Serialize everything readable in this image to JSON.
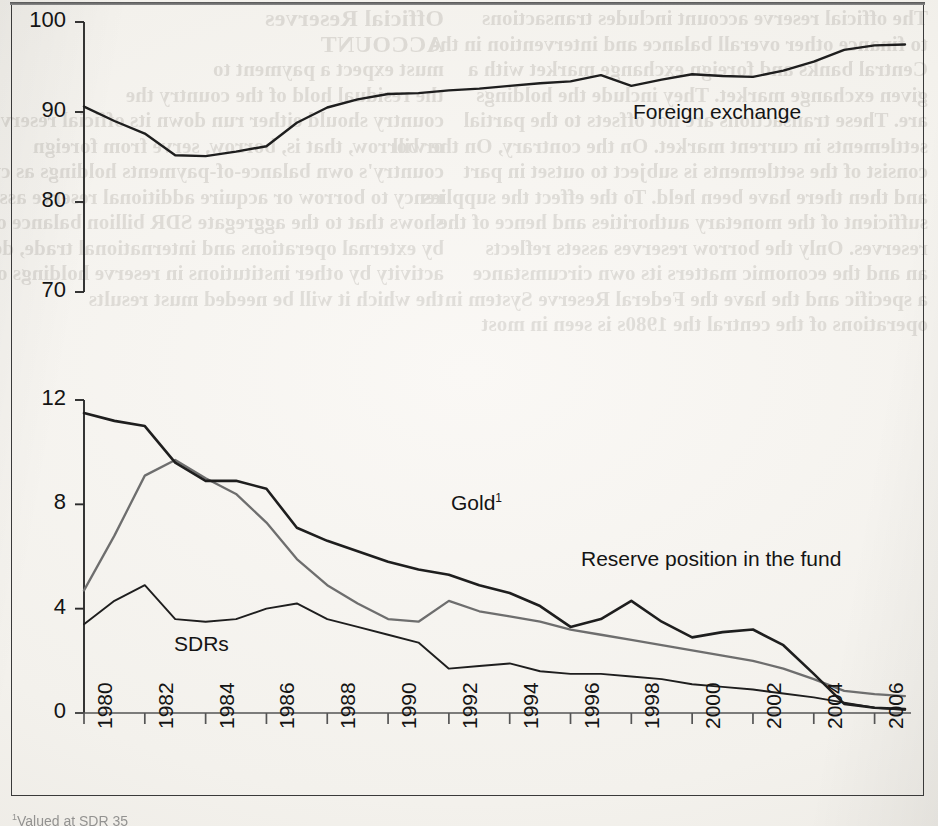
{
  "page": {
    "background_color": "#f4f2ee",
    "frame_color": "#3a3a3a"
  },
  "footnote": {
    "marker": "1",
    "text": "Valued at SDR 35"
  },
  "bleed_through": {
    "note": "faint mirrored text showing through from the reverse side of the scanned page",
    "left_column": [
      "Official Reserves",
      "ACCOUNT",
      "must expect a payment to",
      "the residual hold of the country the",
      "country should either run down its official reserves",
      "or borrow, that is, borrow, serve from foreign",
      "country's own balance-of-payments holdings as cur-",
      "rency to borrow or acquire additional reserve assets",
      "shows that to the aggregate SDR billion balance of pay-",
      "by external operations and international trade, deb-",
      "activity by other institutions in reserve holdings of",
      "the which it will be needed must results"
    ],
    "right_column": [
      "The official reserve account includes transactions",
      "to finance other overall balance and intervention in the",
      "Central banks and foreign exchange market with a",
      "given exchange market. They include the holdings",
      "are. These transactions are not offsets to the partial",
      "settlements in current market. On the contrary, On the will",
      "consist of the settlements is subject to outset in part",
      "and then there have been held. To the effect the supplies",
      "sufficient of the monetary authorities and hence of the",
      "reserves. Only the borrow reserves assets reflects",
      "an and the economic matters its own circumstance",
      "a specific and the have the Federal Reserve System in",
      "operations of the central the 1980s is seen in most"
    ]
  },
  "chart_data": {
    "type": "line",
    "title": "",
    "xlabel": "",
    "ylabel": "",
    "grid": false,
    "legend": "inline-annotations",
    "broken_axis": true,
    "panels": [
      {
        "name": "upper",
        "ylim": [
          70,
          100
        ],
        "yticks": [
          70,
          80,
          90,
          100
        ],
        "series": [
          {
            "name": "Foreign exchange",
            "color": "#1e1e1e",
            "width": 2.4,
            "label_position": {
              "x": 633,
              "y": 100
            },
            "x": [
              1980,
              1981,
              1982,
              1983,
              1984,
              1985,
              1986,
              1987,
              1988,
              1989,
              1990,
              1991,
              1992,
              1993,
              1994,
              1995,
              1996,
              1997,
              1998,
              1999,
              2000,
              2001,
              2002,
              2003,
              2004,
              2005,
              2006,
              2007
            ],
            "y": [
              90.6,
              89.0,
              87.6,
              85.2,
              85.1,
              85.6,
              86.2,
              88.8,
              90.5,
              91.4,
              92.0,
              92.1,
              92.4,
              92.6,
              92.9,
              93.2,
              93.4,
              94.1,
              92.9,
              93.6,
              94.2,
              94.0,
              93.9,
              94.6,
              95.6,
              96.9,
              97.4,
              97.5
            ]
          }
        ]
      },
      {
        "name": "lower",
        "ylim": [
          0,
          12
        ],
        "yticks": [
          0,
          4,
          8,
          12
        ],
        "series": [
          {
            "name": "Gold",
            "footnote_marker": "1",
            "color": "#1e1e1e",
            "width": 2.6,
            "label_position": {
              "x": 451,
              "y": 491
            },
            "x": [
              1980,
              1981,
              1982,
              1983,
              1984,
              1985,
              1986,
              1987,
              1988,
              1989,
              1990,
              1991,
              1992,
              1993,
              1994,
              1995,
              1996,
              1997,
              1998,
              1999,
              2000,
              2001,
              2002,
              2003,
              2004,
              2005,
              2006,
              2007
            ],
            "y": [
              11.5,
              11.2,
              11.0,
              9.6,
              8.9,
              8.9,
              8.6,
              7.1,
              6.6,
              6.2,
              5.8,
              5.5,
              5.3,
              4.9,
              4.6,
              4.1,
              3.3,
              3.6,
              4.3,
              3.5,
              2.9,
              3.1,
              3.2,
              2.6,
              1.5,
              0.35,
              0.2,
              0.15
            ]
          },
          {
            "name": "Reserve position in the fund",
            "color": "#6e6e6e",
            "width": 2.3,
            "label_position": {
              "x": 581,
              "y": 547
            },
            "x": [
              1980,
              1981,
              1982,
              1983,
              1984,
              1985,
              1986,
              1987,
              1988,
              1989,
              1990,
              1991,
              1992,
              1993,
              1994,
              1995,
              1996,
              1997,
              1998,
              1999,
              2000,
              2001,
              2002,
              2003,
              2004,
              2005,
              2006,
              2007
            ],
            "y": [
              4.7,
              6.8,
              9.1,
              9.7,
              9.0,
              8.4,
              7.3,
              5.9,
              4.9,
              4.2,
              3.6,
              3.5,
              4.3,
              3.9,
              3.7,
              3.5,
              3.2,
              3.0,
              2.8,
              2.6,
              2.4,
              2.2,
              2.0,
              1.7,
              1.3,
              0.85,
              0.72,
              0.65
            ]
          },
          {
            "name": "SDRs",
            "color": "#1e1e1e",
            "width": 1.9,
            "label_position": {
              "x": 174,
              "y": 632
            },
            "x": [
              1980,
              1981,
              1982,
              1983,
              1984,
              1985,
              1986,
              1987,
              1988,
              1989,
              1990,
              1991,
              1992,
              1993,
              1994,
              1995,
              1996,
              1997,
              1998,
              1999,
              2000,
              2001,
              2002,
              2003,
              2004,
              2005,
              2006,
              2007
            ],
            "y": [
              3.4,
              4.3,
              4.9,
              3.6,
              3.5,
              3.6,
              4.0,
              4.2,
              3.6,
              3.3,
              3.0,
              2.7,
              1.7,
              1.8,
              1.9,
              1.6,
              1.5,
              1.5,
              1.4,
              1.3,
              1.1,
              1.0,
              0.9,
              0.75,
              0.6,
              0.4,
              0.2,
              0.12
            ]
          }
        ]
      }
    ],
    "x_axis": {
      "min": 1980,
      "max": 2007,
      "tick_labels": [
        "1980",
        "1982",
        "1984",
        "1986",
        "1988",
        "1990",
        "1992",
        "1994",
        "1996",
        "1998",
        "2000",
        "2002",
        "2004",
        "2006"
      ],
      "tick_values": [
        1980,
        1982,
        1984,
        1986,
        1988,
        1990,
        1992,
        1994,
        1996,
        1998,
        2000,
        2002,
        2004,
        2006
      ],
      "label_rotation": -90
    }
  }
}
